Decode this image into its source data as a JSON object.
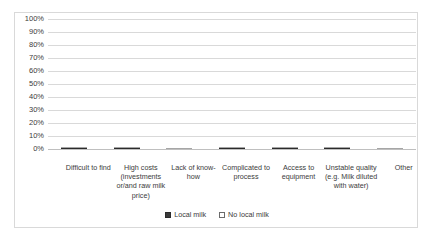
{
  "chart_data": {
    "type": "bar",
    "subtype": "stacked-bar-vertical",
    "title": "",
    "subtitle": "",
    "xlabel": "",
    "ylabel": "",
    "ylim": [
      0,
      100
    ],
    "y_unit": "%",
    "grid": true,
    "legend_position": "bottom-center",
    "categories": [
      "Difficult to find",
      "High costs (investments or/and raw milk price)",
      "Lack of know-how",
      "Complicated to process",
      "Access to equipment",
      "Unstable quality (e.g. Milk diluted with water)",
      "Other"
    ],
    "y_ticks": [
      "0%",
      "10%",
      "20%",
      "30%",
      "40%",
      "50%",
      "60%",
      "70%",
      "80%",
      "90%",
      "100%"
    ],
    "series": [
      {
        "name": "Local milk",
        "color": "#3a3a3a",
        "values": [
          38,
          14,
          0,
          4,
          9,
          2,
          0
        ]
      },
      {
        "name": "No local milk",
        "color": "#ebebeb",
        "values": [
          32,
          17,
          17,
          13,
          9,
          11,
          6
        ]
      }
    ],
    "totals": [
      70,
      31,
      17,
      17,
      18,
      13,
      6
    ]
  },
  "legend": {
    "items": [
      {
        "label": "Local milk"
      },
      {
        "label": "No local milk"
      }
    ]
  },
  "colors": {
    "local_milk": "#3a3a3a",
    "no_local_milk": "#ebebeb",
    "gridline": "#d9d9d9",
    "frame_border": "#d9d9d9",
    "text": "#3b3b3b"
  }
}
